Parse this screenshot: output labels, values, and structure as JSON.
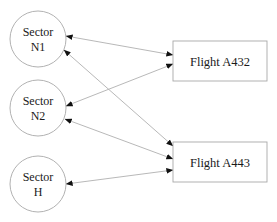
{
  "diagram": {
    "type": "bipartite-network",
    "colors": {
      "node_stroke": "#a8a8a8",
      "edge_stroke": "#b0b0b0",
      "arrowhead": "#111111",
      "text": "#1a1a1a",
      "background": "#ffffff"
    },
    "sectors": [
      {
        "id": "N1",
        "line1": "Sector",
        "line2": "N1",
        "cx": 38,
        "cy": 39,
        "r": 28
      },
      {
        "id": "N2",
        "line1": "Sector",
        "line2": "N2",
        "cx": 38,
        "cy": 108,
        "r": 28
      },
      {
        "id": "H",
        "line1": "Sector",
        "line2": "H",
        "cx": 38,
        "cy": 184,
        "r": 28
      }
    ],
    "flights": [
      {
        "id": "A432",
        "label": "Flight A432",
        "x": 173,
        "y": 41,
        "w": 94,
        "h": 40
      },
      {
        "id": "A443",
        "label": "Flight A443",
        "x": 173,
        "y": 142,
        "w": 94,
        "h": 40
      }
    ],
    "edges": [
      {
        "from": "N1",
        "to": "A432",
        "x1": 66,
        "y1": 36,
        "x2": 173,
        "y2": 55,
        "bidirectional": true
      },
      {
        "from": "N1",
        "to": "A443",
        "x1": 64,
        "y1": 50,
        "x2": 173,
        "y2": 146,
        "bidirectional": true
      },
      {
        "from": "N2",
        "to": "A432",
        "x1": 66,
        "y1": 106,
        "x2": 173,
        "y2": 64,
        "bidirectional": true
      },
      {
        "from": "N2",
        "to": "A443",
        "x1": 65,
        "y1": 119,
        "x2": 173,
        "y2": 159,
        "bidirectional": true
      },
      {
        "from": "H",
        "to": "A443",
        "x1": 66,
        "y1": 184,
        "x2": 173,
        "y2": 170,
        "bidirectional": true
      }
    ]
  }
}
